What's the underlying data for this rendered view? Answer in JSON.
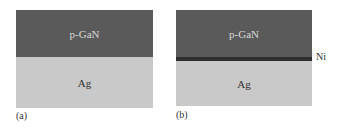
{
  "panels": [
    {
      "caption": "(a)",
      "layers": [
        {
          "name": "p-GaN",
          "color": "#5a5a5a"
        },
        {
          "name": "Ag",
          "color": "#c9c9c9"
        }
      ]
    },
    {
      "caption": "(b)",
      "layers": [
        {
          "name": "p-GaN",
          "color": "#5a5a5a"
        },
        {
          "name": "Ni",
          "color": "#2e2e2e"
        },
        {
          "name": "Ag",
          "color": "#c9c9c9"
        }
      ],
      "side_label": "Ni"
    }
  ]
}
